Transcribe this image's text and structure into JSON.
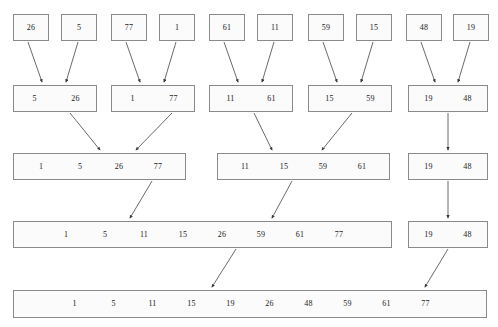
{
  "diagram": {
    "colors": {
      "background": "#ffffff",
      "box_fill": "#fbfbfb",
      "box_border": "#8a8a8a",
      "arrow": "#444444",
      "text": "#1a1a1a"
    },
    "levels": [
      {
        "name": "level-1-singletons",
        "boxes": [
          {
            "values": [
              "26"
            ],
            "x": 13,
            "y": 14,
            "w": 36,
            "h": 27,
            "cell_w": 34
          },
          {
            "values": [
              "5"
            ],
            "x": 61,
            "y": 14,
            "w": 36,
            "h": 27,
            "cell_w": 34
          },
          {
            "values": [
              "77"
            ],
            "x": 111,
            "y": 14,
            "w": 36,
            "h": 27,
            "cell_w": 34
          },
          {
            "values": [
              "1"
            ],
            "x": 159,
            "y": 14,
            "w": 36,
            "h": 27,
            "cell_w": 34
          },
          {
            "values": [
              "61"
            ],
            "x": 209,
            "y": 14,
            "w": 36,
            "h": 27,
            "cell_w": 34
          },
          {
            "values": [
              "11"
            ],
            "x": 257,
            "y": 14,
            "w": 36,
            "h": 27,
            "cell_w": 34
          },
          {
            "values": [
              "59"
            ],
            "x": 308,
            "y": 14,
            "w": 36,
            "h": 27,
            "cell_w": 34
          },
          {
            "values": [
              "15"
            ],
            "x": 356,
            "y": 14,
            "w": 36,
            "h": 27,
            "cell_w": 34
          },
          {
            "values": [
              "48"
            ],
            "x": 406,
            "y": 14,
            "w": 36,
            "h": 27,
            "cell_w": 34
          },
          {
            "values": [
              "19"
            ],
            "x": 453,
            "y": 14,
            "w": 36,
            "h": 27,
            "cell_w": 34
          }
        ]
      },
      {
        "name": "level-2-pairs",
        "boxes": [
          {
            "values": [
              "5",
              "26"
            ],
            "x": 13,
            "y": 85,
            "w": 84,
            "h": 27,
            "cell_w": 41
          },
          {
            "values": [
              "1",
              "77"
            ],
            "x": 111,
            "y": 85,
            "w": 84,
            "h": 27,
            "cell_w": 41
          },
          {
            "values": [
              "11",
              "61"
            ],
            "x": 209,
            "y": 85,
            "w": 84,
            "h": 27,
            "cell_w": 41
          },
          {
            "values": [
              "15",
              "59"
            ],
            "x": 308,
            "y": 85,
            "w": 84,
            "h": 27,
            "cell_w": 41
          },
          {
            "values": [
              "19",
              "48"
            ],
            "x": 408,
            "y": 85,
            "w": 80,
            "h": 27,
            "cell_w": 39
          }
        ]
      },
      {
        "name": "level-3-quads",
        "boxes": [
          {
            "values": [
              "1",
              "5",
              "26",
              "77"
            ],
            "x": 13,
            "y": 153,
            "w": 173,
            "h": 27,
            "cell_w": 39
          },
          {
            "values": [
              "11",
              "15",
              "59",
              "61"
            ],
            "x": 217,
            "y": 153,
            "w": 173,
            "h": 27,
            "cell_w": 39
          },
          {
            "values": [
              "19",
              "48"
            ],
            "x": 408,
            "y": 153,
            "w": 80,
            "h": 27,
            "cell_w": 39
          }
        ]
      },
      {
        "name": "level-4-eight",
        "boxes": [
          {
            "values": [
              "1",
              "5",
              "11",
              "15",
              "26",
              "59",
              "61",
              "77"
            ],
            "x": 13,
            "y": 221,
            "w": 379,
            "h": 27,
            "cell_w": 39
          },
          {
            "values": [
              "19",
              "48"
            ],
            "x": 408,
            "y": 221,
            "w": 80,
            "h": 27,
            "cell_w": 39
          }
        ]
      },
      {
        "name": "level-5-final",
        "boxes": [
          {
            "values": [
              "1",
              "5",
              "11",
              "15",
              "19",
              "26",
              "48",
              "59",
              "61",
              "77"
            ],
            "x": 13,
            "y": 290,
            "w": 474,
            "h": 28,
            "cell_w": 39
          }
        ]
      }
    ],
    "arrows": [
      {
        "name": "arrow-26-to-pair1",
        "x1": 28,
        "y1": 42,
        "x2": 42,
        "y2": 82
      },
      {
        "name": "arrow-5-to-pair1",
        "x1": 78,
        "y1": 42,
        "x2": 66,
        "y2": 82
      },
      {
        "name": "arrow-77-to-pair2",
        "x1": 126,
        "y1": 42,
        "x2": 140,
        "y2": 82
      },
      {
        "name": "arrow-1-to-pair2",
        "x1": 176,
        "y1": 42,
        "x2": 164,
        "y2": 82
      },
      {
        "name": "arrow-61-to-pair3",
        "x1": 224,
        "y1": 42,
        "x2": 238,
        "y2": 82
      },
      {
        "name": "arrow-11-to-pair3",
        "x1": 274,
        "y1": 42,
        "x2": 262,
        "y2": 82
      },
      {
        "name": "arrow-59-to-pair4",
        "x1": 323,
        "y1": 42,
        "x2": 337,
        "y2": 82
      },
      {
        "name": "arrow-15-to-pair4",
        "x1": 373,
        "y1": 42,
        "x2": 361,
        "y2": 82
      },
      {
        "name": "arrow-48-to-pair5",
        "x1": 421,
        "y1": 42,
        "x2": 435,
        "y2": 82
      },
      {
        "name": "arrow-19-to-pair5",
        "x1": 470,
        "y1": 42,
        "x2": 458,
        "y2": 82
      },
      {
        "name": "arrow-pair1-to-quad1",
        "x1": 70,
        "y1": 113,
        "x2": 100,
        "y2": 150
      },
      {
        "name": "arrow-pair2-to-quad1",
        "x1": 172,
        "y1": 113,
        "x2": 136,
        "y2": 150
      },
      {
        "name": "arrow-pair3-to-quad2",
        "x1": 254,
        "y1": 113,
        "x2": 272,
        "y2": 150
      },
      {
        "name": "arrow-pair4-to-quad2",
        "x1": 352,
        "y1": 113,
        "x2": 322,
        "y2": 150
      },
      {
        "name": "arrow-pair5-to-quad3",
        "x1": 448,
        "y1": 113,
        "x2": 448,
        "y2": 150
      },
      {
        "name": "arrow-quad1-to-eight",
        "x1": 152,
        "y1": 181,
        "x2": 130,
        "y2": 218
      },
      {
        "name": "arrow-quad2-to-eight",
        "x1": 292,
        "y1": 181,
        "x2": 272,
        "y2": 218
      },
      {
        "name": "arrow-quad3-to-right",
        "x1": 448,
        "y1": 181,
        "x2": 448,
        "y2": 218
      },
      {
        "name": "arrow-eight-to-final",
        "x1": 236,
        "y1": 249,
        "x2": 212,
        "y2": 287
      },
      {
        "name": "arrow-right-to-final",
        "x1": 448,
        "y1": 249,
        "x2": 425,
        "y2": 287
      }
    ]
  }
}
